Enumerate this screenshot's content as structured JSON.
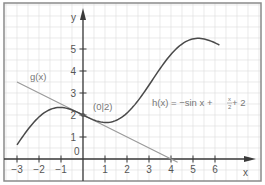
{
  "chart_data": {
    "type": "line",
    "title": "",
    "xlabel": "x",
    "ylabel": "y",
    "xlim": [
      -3.4,
      8.0
    ],
    "ylim": [
      -1.0,
      7.0
    ],
    "grid": true,
    "grid_step": 0.5,
    "legend_position": "none",
    "x_ticks": [
      -3,
      -2,
      -1,
      1,
      2,
      3,
      4,
      5,
      6
    ],
    "x_tick_labels": [
      "−3",
      "−2",
      "−1",
      "1",
      "2",
      "3",
      "4",
      "5",
      "6"
    ],
    "y_ticks": [
      1,
      2,
      3,
      4,
      5
    ],
    "y_tick_labels": [
      "1",
      "2",
      "3",
      "4",
      "5"
    ],
    "origin_label": "0",
    "series": [
      {
        "name": "h(x)",
        "label": "h(x) = −sin x + x/2 + 2",
        "formula": "-sin(x) + x/2 + 2",
        "x_range": [
          -3,
          6.2
        ],
        "color": "#4a4a4a",
        "x": [
          -3,
          -2.5,
          -2,
          -1.5,
          -1,
          -0.5,
          0,
          0.5,
          1,
          1.5,
          2,
          2.5,
          3,
          3.5,
          4,
          4.5,
          5,
          5.5,
          6,
          6.2
        ],
        "values": [
          0.64,
          1.35,
          1.91,
          2.25,
          2.34,
          2.23,
          2.0,
          1.77,
          1.66,
          1.75,
          2.09,
          2.65,
          3.36,
          4.1,
          4.76,
          5.23,
          5.46,
          5.46,
          5.28,
          5.18
        ]
      },
      {
        "name": "g(x)",
        "label": "g(x)",
        "formula": "-0.5*x + 2",
        "x_range": [
          -3,
          4.3
        ],
        "color": "#9a9a9a",
        "x": [
          -3,
          4.3
        ],
        "values": [
          3.5,
          -0.15
        ]
      }
    ],
    "annotations": [
      {
        "text": "(0|2)",
        "x": 0,
        "y": 2
      },
      {
        "text": "g(x)",
        "x": -2.1,
        "y": 3.6
      },
      {
        "text": "h(x) = −sin x + x/2 + 2",
        "x": 2.4,
        "y": 2.4
      }
    ]
  },
  "labels": {
    "h_prefix": "h(x) = −sin x + ",
    "h_frac_num": "x",
    "h_frac_den": "2",
    "h_suffix": " + 2",
    "g": "g(x)",
    "point": "(0|2)",
    "x_axis": "x",
    "y_axis": "y",
    "origin": "0"
  },
  "layout": {
    "frame": {
      "left": 4,
      "top": 3,
      "right": 261,
      "bottom": 181
    },
    "origin_px": {
      "x": 83,
      "y": 159
    },
    "unit_px": 22,
    "colors": {
      "grid": "#dcdcdc",
      "frame": "#8a8a8a",
      "axis": "#3a3a3a",
      "h_curve": "#4a4a4a",
      "g_line": "#9a9a9a"
    }
  }
}
